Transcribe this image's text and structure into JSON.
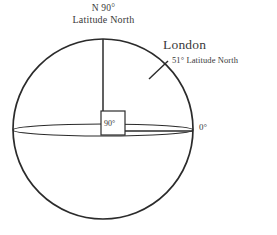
{
  "figure": {
    "background_color": "#ffffff",
    "stroke_color": "#2b2b2b",
    "text_color": "#3a3a3a"
  },
  "labels": {
    "pole_line1": "N 90°",
    "pole_line2": "Latitude North",
    "london_name": "London",
    "london_sub": "51° Latitude North",
    "equator_zero": "0°",
    "right_angle": "90°"
  },
  "geometry": {
    "sphere": {
      "center_x": 103,
      "center_y": 129,
      "radius": 90
    },
    "equator_ellipse": {
      "center_x": 103,
      "center_y": 130,
      "radius_x": 90,
      "radius_y": 6
    },
    "polar_axis": {
      "x": 103,
      "y_top": 39,
      "y_bottom": 131
    },
    "equator_radius_line": {
      "y": 131,
      "x_start": 103,
      "x_end": 193
    },
    "right_angle_box": {
      "x": 101,
      "y": 111,
      "size": 24
    },
    "london_tick": {
      "x1": 149,
      "y1": 79,
      "x2": 168,
      "y2": 61,
      "latitude_degrees": 51
    }
  }
}
